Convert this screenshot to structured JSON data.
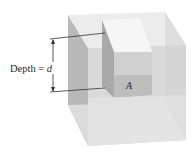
{
  "figure": {
    "depth_label": "Depth = ",
    "depth_symbol": "d",
    "area_label": "A"
  },
  "colors": {
    "background": "#ffffff",
    "cube_top": "#ececec",
    "cube_left_face": "#b9b9b9",
    "cube_front_face": "#dadada",
    "cube_right_face": "#cfcfcf",
    "column_top": "#f6f6f6",
    "column_left_wall": "#a9a9a9",
    "column_back_wall": "#d0d0d0",
    "area_face": "#bdbdbd",
    "lines": "#333333"
  }
}
